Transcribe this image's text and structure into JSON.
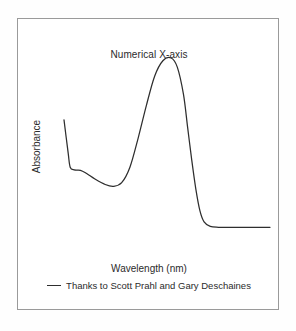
{
  "figure": {
    "frame_border_color": "#9a9a9a",
    "background_color": "#ffffff",
    "page_background_color": "#fefefe"
  },
  "chart_data": {
    "type": "line",
    "title": "Numerical X-axis",
    "xlabel": "Wavelength (nm)",
    "ylabel": "Absorbance",
    "grid": false,
    "axis_ticks": false,
    "axis_lines": false,
    "legend_position": "below-plot",
    "legend": [
      {
        "name": "Thanks to Scott Prahl and Gary Deschaines",
        "marker": "line-dash",
        "color": "#2e2e2e"
      }
    ],
    "annotations": [],
    "xlim": [
      0,
      1
    ],
    "ylim": [
      0,
      1
    ],
    "series": [
      {
        "name": "Thanks to Scott Prahl and Gary Deschaines",
        "color": "#2e2e2e",
        "x": [
          0.0,
          0.02,
          0.03,
          0.05,
          0.08,
          0.11,
          0.15,
          0.2,
          0.24,
          0.28,
          0.32,
          0.36,
          0.4,
          0.44,
          0.48,
          0.52,
          0.55,
          0.58,
          0.6,
          0.62,
          0.64,
          0.66,
          0.68,
          0.71,
          0.75,
          0.8,
          0.88,
          1.0
        ],
        "y": [
          0.66,
          0.48,
          0.4,
          0.385,
          0.383,
          0.365,
          0.335,
          0.305,
          0.295,
          0.315,
          0.4,
          0.56,
          0.74,
          0.9,
          0.985,
          1.0,
          0.95,
          0.8,
          0.62,
          0.44,
          0.28,
          0.16,
          0.1,
          0.075,
          0.07,
          0.07,
          0.07,
          0.07
        ],
        "description": "Absorbance spectrum: steep left edge descent, a shoulder shelf, a broad shallow minimum, then a large symmetric absorption peak followed by a sharp drop to a flat baseline tail"
      }
    ],
    "features": {
      "left_edge_start_value": 0.66,
      "shoulder_value": 0.385,
      "minimum_value": 0.295,
      "peak_value": 1.0,
      "baseline_tail_value": 0.07
    }
  }
}
